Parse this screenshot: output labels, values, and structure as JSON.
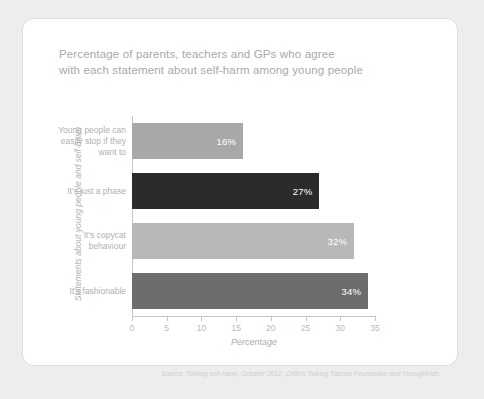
{
  "card": {
    "title": "Percentage of parents, teachers and GPs who agree\nwith each statement about self-harm among young people",
    "source": "Source: Talking self-harm, October 2012, Cello's Talking Taboos Foundation and YoungMinds"
  },
  "chart_data": {
    "type": "bar",
    "orientation": "horizontal",
    "title": "Percentage of parents, teachers and GPs who agree with each statement about self-harm among young people",
    "xlabel": "Percentage",
    "ylabel": "Statements about young people and self-harm",
    "xlim": [
      0,
      35
    ],
    "xticks": [
      0,
      5,
      10,
      15,
      20,
      25,
      30,
      35
    ],
    "grid": false,
    "legend": false,
    "categories": [
      "Young people can\neasily stop if they\nwant to",
      "It's just a phase",
      "It's copycat\nbehaviour",
      "It's fashionable"
    ],
    "values": [
      16,
      27,
      32,
      34
    ],
    "value_labels": [
      "16%",
      "27%",
      "32%",
      "34%"
    ],
    "bar_colors": [
      "#a8a8a8",
      "#2b2b2b",
      "#b8b8b8",
      "#6d6d6d"
    ],
    "source": "Source: Talking self-harm, October 2012, Cello's Talking Taboos Foundation and YoungMinds"
  },
  "ticks": [
    {
      "label": "0"
    },
    {
      "label": "5"
    },
    {
      "label": "10"
    },
    {
      "label": "15"
    },
    {
      "label": "20"
    },
    {
      "label": "25"
    },
    {
      "label": "30"
    },
    {
      "label": "35"
    }
  ]
}
